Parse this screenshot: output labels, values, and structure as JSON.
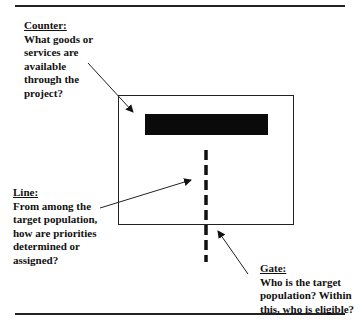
{
  "diagram": {
    "counter": {
      "title": "Counter:",
      "lines": [
        "What goods or",
        "services are",
        "available",
        "through the",
        "project?"
      ]
    },
    "line": {
      "title": "Line:",
      "lines": [
        "From among the",
        "target population,",
        "how are priorities",
        "determined or",
        "assigned?"
      ]
    },
    "gate": {
      "title": "Gate:",
      "lines": [
        "Who is the target",
        "population? Within",
        "this, who is eligible?"
      ]
    },
    "colors": {
      "ink": "#111111",
      "rule": "#222222",
      "background": "#ffffff"
    }
  }
}
